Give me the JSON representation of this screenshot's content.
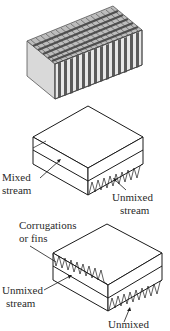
{
  "figures": [
    {
      "id": "plate-fin-block",
      "description": "Finned block with alternating dark/light vertical fins",
      "colors": {
        "dark_fin": "#5a5a5a",
        "light_fin": "#e6e6e6",
        "side_face": "#d8d8d8"
      }
    },
    {
      "id": "mixed-unmixed-exchanger",
      "labels": {
        "mixed_line1": "Mixed",
        "mixed_line2": "stream",
        "unmixed": "Unmixed",
        "unmixed_line2": "stream"
      }
    },
    {
      "id": "both-unmixed-exchanger",
      "labels": {
        "corrugations_line1": "Corrugations",
        "corrugations_line2": "or fins",
        "unmixed_left_line1": "Unmixed",
        "unmixed_left_line2": "stream",
        "unmixed_bottom": "Unmixed"
      }
    }
  ]
}
